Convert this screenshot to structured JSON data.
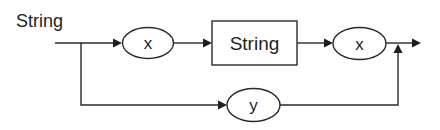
{
  "diagram": {
    "title": "String",
    "nodes": {
      "x1": {
        "label": "x",
        "shape": "ellipse"
      },
      "string_box": {
        "label": "String",
        "shape": "rectangle"
      },
      "x2": {
        "label": "x",
        "shape": "ellipse"
      },
      "y": {
        "label": "y",
        "shape": "ellipse"
      }
    },
    "paths": {
      "top": [
        "start",
        "x",
        "String",
        "x",
        "end"
      ],
      "bottom": [
        "start",
        "y",
        "end"
      ]
    },
    "colors": {
      "stroke": "#2a2a2a",
      "text": "#1e1e1e",
      "background": "#ffffff"
    }
  }
}
